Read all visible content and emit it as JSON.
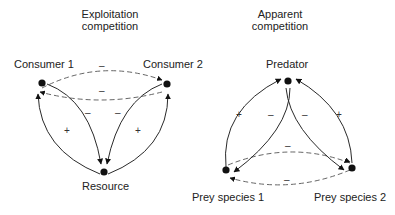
{
  "left_panel": {
    "title_line1": "Exploitation",
    "title_line2": "competition",
    "nodes": {
      "consumer1": "Consumer 1",
      "consumer2": "Consumer 2",
      "resource": "Resource"
    },
    "signs": {
      "top_dashed": "–",
      "bottom_dashed": "–",
      "inner_left": "–",
      "inner_right": "–",
      "outer_left": "+",
      "outer_right": "+"
    }
  },
  "right_panel": {
    "title_line1": "Apparent",
    "title_line2": "competition",
    "nodes": {
      "predator": "Predator",
      "prey1": "Prey species 1",
      "prey2": "Prey species 2"
    },
    "signs": {
      "top_dashed": "–",
      "bottom_dashed": "–",
      "inner_left": "–",
      "inner_right": "–",
      "outer_left": "+",
      "outer_right": "+"
    }
  },
  "colors": {
    "line": "#2a2a2a",
    "dashed": "#555555",
    "node": "#111111"
  }
}
